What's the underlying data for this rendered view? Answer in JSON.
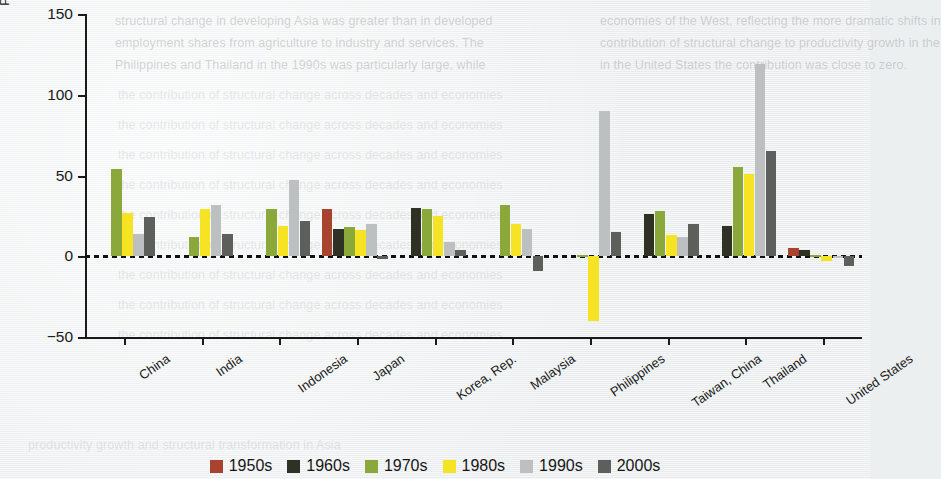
{
  "chart_data": {
    "type": "bar",
    "title": "",
    "subtitle": "",
    "xlabel": "",
    "ylabel": "Percentage of productivity growth contributed by structural change",
    "ylim": [
      -50,
      150
    ],
    "yticks": [
      150,
      100,
      50,
      0,
      -50
    ],
    "ytick_labels": [
      "150",
      "100",
      "50",
      "0",
      "−50"
    ],
    "grid": false,
    "zero_line": true,
    "legend_position": "bottom",
    "categories": [
      "China",
      "India",
      "Indonesia",
      "Japan",
      "Korea, Rep.",
      "Malaysia",
      "Philippines",
      "Taiwan, China",
      "Thailand",
      "United States"
    ],
    "series": [
      {
        "name": "1950s",
        "color": "#a8432f",
        "values": [
          null,
          null,
          null,
          29,
          null,
          null,
          null,
          null,
          null,
          5
        ]
      },
      {
        "name": "1960s",
        "color": "#2f3124",
        "values": [
          null,
          null,
          null,
          17,
          30,
          null,
          null,
          26,
          19,
          4
        ]
      },
      {
        "name": "1970s",
        "color": "#8ba83a",
        "values": [
          54,
          12,
          29,
          18,
          29,
          32,
          1,
          28,
          55,
          1
        ]
      },
      {
        "name": "1980s",
        "color": "#f5e324",
        "values": [
          27,
          29,
          19,
          16,
          25,
          20,
          -40,
          13,
          51,
          -3
        ]
      },
      {
        "name": "1990s",
        "color": "#bcc0c0",
        "values": [
          14,
          32,
          47,
          20,
          9,
          17,
          90,
          12,
          119,
          0
        ]
      },
      {
        "name": "2000s",
        "color": "#5d5f5c",
        "values": [
          24,
          14,
          22,
          -2,
          4,
          -9,
          15,
          20,
          65,
          -6
        ]
      }
    ]
  },
  "ghost_text": {
    "lines": [
      "structural change in developing Asia was greater than in developed",
      "economies of the West, reflecting the more dramatic shifts in",
      "employment shares from agriculture to industry and services. The",
      "contribution of structural change to productivity growth in the",
      "Philippines and Thailand in the 1990s was particularly large, while",
      "in the United States the contribution was close to zero."
    ]
  }
}
